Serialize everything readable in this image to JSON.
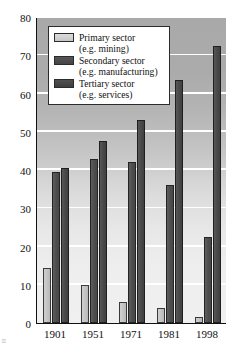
{
  "chart_data": {
    "type": "bar",
    "title": "",
    "xlabel": "",
    "ylabel": "Employment percentages of total",
    "categories": [
      "1901",
      "1951",
      "1971",
      "1981",
      "1998"
    ],
    "ylim": [
      0,
      80
    ],
    "yticks": [
      0,
      10,
      20,
      30,
      40,
      50,
      60,
      70,
      80
    ],
    "grid": true,
    "legend_position": "top-center-inside",
    "series": [
      {
        "name": "Primary sector",
        "sublabel": "(e.g. mining)",
        "color": "#c6c6c6",
        "values": [
          14.5,
          10,
          5.5,
          4,
          1.5
        ]
      },
      {
        "name": "Secondary sector",
        "sublabel": "(e.g. manufacturing)",
        "color": "#4d4d4d",
        "values": [
          39.5,
          43,
          42,
          36,
          22.5
        ]
      },
      {
        "name": "Tertiary sector",
        "sublabel": "(e.g. services)",
        "color": "#434343",
        "values": [
          40.5,
          47.5,
          53,
          63.5,
          72.5
        ]
      }
    ]
  },
  "artifact": {
    "mark": "≡"
  }
}
